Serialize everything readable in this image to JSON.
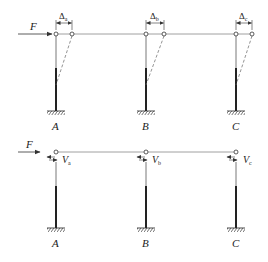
{
  "diagram": {
    "type": "structural-frame",
    "colors": {
      "line": "#333333",
      "dashed": "#666666",
      "background": "#ffffff"
    },
    "top_frame": {
      "load_label": "F",
      "displacements": [
        {
          "symbol": "Δ",
          "subscript": "a"
        },
        {
          "symbol": "Δ",
          "subscript": "b"
        },
        {
          "symbol": "Δ",
          "subscript": "c"
        }
      ],
      "columns": [
        {
          "label": "A"
        },
        {
          "label": "B"
        },
        {
          "label": "C"
        }
      ]
    },
    "bottom_frame": {
      "load_label": "F",
      "shears": [
        {
          "symbol": "V",
          "subscript": "a"
        },
        {
          "symbol": "V",
          "subscript": "b"
        },
        {
          "symbol": "V",
          "subscript": "c"
        }
      ],
      "columns": [
        {
          "label": "A"
        },
        {
          "label": "B"
        },
        {
          "label": "C"
        }
      ]
    }
  }
}
